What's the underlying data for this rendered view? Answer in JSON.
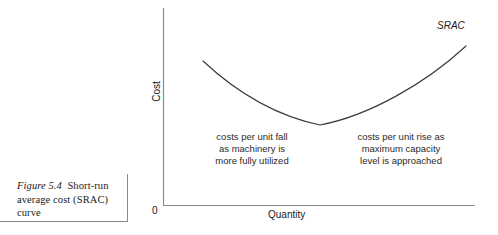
{
  "figure": {
    "caption_number": "Figure 5.4",
    "caption_title": "Short-run average cost (SRAC) curve"
  },
  "axes": {
    "y_label": "Cost",
    "x_label": "Quantity",
    "origin_label": "0"
  },
  "curve": {
    "label": "SRAC"
  },
  "annotations": {
    "left": "costs per unit fall\nas machinery is\nmore fully utilized",
    "right": "costs per unit rise as\nmaximum capacity\nlevel is approached"
  },
  "chart_data": {
    "type": "line",
    "title": "Short-run average cost (SRAC) curve",
    "xlabel": "Quantity",
    "ylabel": "Cost",
    "grid": false,
    "legend": "none",
    "axis_origin_label": "0",
    "series": [
      {
        "name": "SRAC",
        "shape": "u-shaped convex curve",
        "points_px": [
          [
            203,
            61
          ],
          [
            230,
            83
          ],
          [
            258,
            102
          ],
          [
            288,
            117
          ],
          [
            320,
            125
          ],
          [
            352,
            120
          ],
          [
            382,
            104
          ],
          [
            412,
            83
          ],
          [
            440,
            63
          ],
          [
            466,
            46
          ]
        ],
        "minimum_px": [
          320,
          125
        ],
        "annotation_left": "costs per unit fall as machinery is more fully utilized",
        "annotation_right": "costs per unit rise as maximum capacity level is approached"
      }
    ],
    "xlim_px": [
      163,
      475
    ],
    "ylim_px": [
      205,
      8
    ]
  },
  "colors": {
    "ink": "#1a1a1a",
    "axis": "#8a8a8a",
    "curve": "#3a3a3a",
    "background": "#ffffff"
  }
}
